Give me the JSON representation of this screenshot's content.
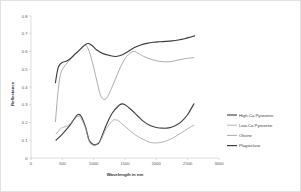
{
  "chart_data": {
    "type": "line",
    "title": "",
    "xlabel": "Wavelength in nm",
    "ylabel": "Reflectance",
    "xlim": [
      0,
      3000
    ],
    "ylim": [
      0,
      0.8
    ],
    "xticks": [
      "0",
      "500",
      "1000",
      "1500",
      "2000",
      "2500",
      "3000"
    ],
    "yticks": [
      "0",
      "0.1",
      "0.2",
      "0.3",
      "0.4",
      "0.5",
      "0.6",
      "0.7",
      "0.8"
    ],
    "grid": false,
    "legend_position": "right",
    "series": [
      {
        "name": "High-Ca Pyroxene",
        "color": "#404040",
        "width": 1.15,
        "x": [
          400,
          500,
          600,
          700,
          750,
          800,
          870,
          930,
          1000,
          1050,
          1100,
          1200,
          1300,
          1400,
          1450,
          1500,
          1600,
          1700,
          1800,
          1900,
          2000,
          2100,
          2200,
          2300,
          2400,
          2500,
          2600
        ],
        "y": [
          0.1,
          0.135,
          0.175,
          0.225,
          0.245,
          0.235,
          0.175,
          0.098,
          0.075,
          0.078,
          0.095,
          0.185,
          0.255,
          0.295,
          0.305,
          0.3,
          0.272,
          0.238,
          0.205,
          0.183,
          0.172,
          0.168,
          0.17,
          0.182,
          0.205,
          0.245,
          0.305
        ]
      },
      {
        "name": "Low-Ca Pyroxene",
        "color": "#9a9a9a",
        "width": 0.75,
        "x": [
          400,
          470,
          520,
          600,
          700,
          750,
          800,
          870,
          930,
          1000,
          1060,
          1120,
          1200,
          1300,
          1350,
          1400,
          1500,
          1600,
          1700,
          1800,
          1900,
          2000,
          2100,
          2200,
          2300,
          2400,
          2500,
          2600
        ],
        "y": [
          0.135,
          0.165,
          0.173,
          0.185,
          0.222,
          0.235,
          0.222,
          0.168,
          0.092,
          0.07,
          0.078,
          0.105,
          0.165,
          0.21,
          0.215,
          0.208,
          0.178,
          0.148,
          0.122,
          0.103,
          0.088,
          0.085,
          0.09,
          0.102,
          0.12,
          0.142,
          0.165,
          0.185
        ]
      },
      {
        "name": "Olivine",
        "color": "#8f8f8f",
        "width": 0.75,
        "x": [
          390,
          430,
          470,
          520,
          600,
          700,
          800,
          870,
          930,
          1000,
          1060,
          1120,
          1200,
          1300,
          1400,
          1500,
          1600,
          1650,
          1700,
          1800,
          1900,
          2000,
          2100,
          2200,
          2300,
          2400,
          2500,
          2600
        ],
        "y": [
          0.205,
          0.37,
          0.47,
          0.51,
          0.545,
          0.58,
          0.615,
          0.635,
          0.6,
          0.51,
          0.42,
          0.345,
          0.335,
          0.405,
          0.49,
          0.56,
          0.595,
          0.6,
          0.592,
          0.572,
          0.558,
          0.548,
          0.543,
          0.542,
          0.548,
          0.556,
          0.562,
          0.565
        ]
      },
      {
        "name": "Plagioclase",
        "color": "#3d3d3d",
        "width": 1.15,
        "x": [
          390,
          430,
          470,
          510,
          560,
          620,
          700,
          800,
          870,
          920,
          980,
          1050,
          1150,
          1250,
          1350,
          1450,
          1550,
          1650,
          1750,
          1850,
          1950,
          2050,
          2150,
          2250,
          2350,
          2450,
          2550,
          2610
        ],
        "y": [
          0.425,
          0.505,
          0.53,
          0.54,
          0.545,
          0.558,
          0.585,
          0.618,
          0.64,
          0.645,
          0.632,
          0.608,
          0.588,
          0.578,
          0.572,
          0.58,
          0.6,
          0.622,
          0.637,
          0.646,
          0.652,
          0.655,
          0.657,
          0.66,
          0.665,
          0.672,
          0.682,
          0.688
        ]
      }
    ]
  }
}
